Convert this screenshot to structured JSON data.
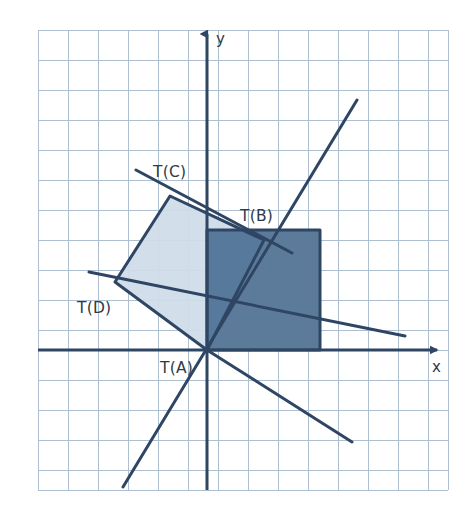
{
  "figure": {
    "kind": "coordinate-plane-diagram",
    "topic": "rotation transformation of a square about the origin",
    "background_color": "#ffffff",
    "width": 475,
    "height": 527
  },
  "grid": {
    "visible": true,
    "line_color": "#aebfd2",
    "minor_line_color": "#c9d6e4",
    "spacing_px": 30,
    "left_px": 38,
    "top_px": 30,
    "right_px": 448,
    "bottom_px": 490,
    "columns": 14,
    "rows": 15
  },
  "axes": {
    "color": "#2e4663",
    "stroke_width": 3,
    "origin_px": {
      "x": 207,
      "y": 350
    },
    "x_axis": {
      "label": "x",
      "label_px": {
        "x": 432,
        "y": 372
      },
      "from_px": {
        "x": 38,
        "y": 350
      },
      "to_px": {
        "x": 443,
        "y": 350
      },
      "arrow": "right"
    },
    "y_axis": {
      "label": "y",
      "label_px": {
        "x": 216,
        "y": 44
      },
      "from_px": {
        "x": 207,
        "y": 490
      },
      "to_px": {
        "x": 207,
        "y": 28
      },
      "arrow": "up"
    }
  },
  "shapes": {
    "preimage_square": {
      "name": "original square",
      "fill": "#5c7b9b",
      "fill_opacity": 1,
      "stroke": "#2e4663",
      "stroke_width": 3,
      "points_px": "207,350 320,350 320,230 207,230",
      "vertices_units": [
        {
          "label": "A",
          "x": 0,
          "y": 0
        },
        {
          "label": "B",
          "x": 3.8,
          "y": 4
        },
        {
          "label": "C",
          "x": 0,
          "y": 4
        },
        {
          "label": "D",
          "x": 3.8,
          "y": 0
        }
      ]
    },
    "image_square": {
      "name": "rotated image square",
      "fill": "#cfdce8",
      "fill_opacity": 1,
      "stroke": "#2e4663",
      "stroke_width": 3,
      "points_px": "207,350 170,196 115,282 264,240",
      "ordered_points_px": "207,350 115,282 170,196 264,240",
      "rotation_deg": 40
    }
  },
  "lines": [
    {
      "name": "rotated-x-axis-image",
      "from_px": {
        "x": 123,
        "y": 487
      },
      "to_px": {
        "x": 357,
        "y": 100
      },
      "stroke": "#2e4663",
      "stroke_width": 3
    },
    {
      "name": "rotated-y-axis-image",
      "from_px": {
        "x": 89,
        "y": 272
      },
      "to_px": {
        "x": 405,
        "y": 336
      },
      "stroke": "#2e4663",
      "stroke_width": 3
    },
    {
      "name": "square-upper-edge-extension",
      "from_px": {
        "x": 136,
        "y": 170
      },
      "to_px": {
        "x": 290,
        "y": 252
      },
      "stroke": "#2e4663",
      "stroke_width": 3
    },
    {
      "name": "square-lower-edge-extension",
      "from_px": {
        "x": 207,
        "y": 350
      },
      "to_px": {
        "x": 352,
        "y": 442
      },
      "stroke": "#2e4663",
      "stroke_width": 3
    }
  ],
  "labels": {
    "t_a": {
      "text": "T(A)",
      "x_px": 160,
      "y_px": 373
    },
    "t_b": {
      "text": "T(B)",
      "x_px": 240,
      "y_px": 221
    },
    "t_c": {
      "text": "T(C)",
      "x_px": 153,
      "y_px": 177
    },
    "t_d": {
      "text": "T(D)",
      "x_px": 77,
      "y_px": 313
    }
  },
  "colors": {
    "axis_navy": "#2e4663",
    "image_fill_light": "#cfdce8",
    "preimage_fill_dark": "#5c7b9b",
    "grid_blue": "#aebfd2",
    "text_ink": "#2f3a45",
    "page_white": "#ffffff"
  }
}
